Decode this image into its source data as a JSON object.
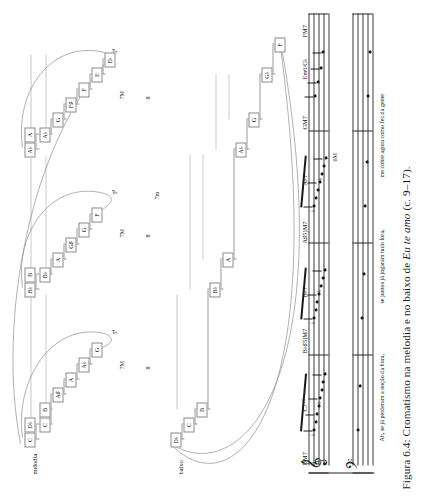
{
  "figure": {
    "caption_prefix": "Figura 6.4: Cromatismo na melodia e no baixo de ",
    "caption_italic": "Eu te amo",
    "caption_suffix": " (c. 9–17).",
    "voice_labels": {
      "melody": "melodia",
      "bass": "baixo"
    }
  },
  "melody_groups": [
    {
      "notes": [
        "C",
        "D♭",
        "C",
        "B",
        "A♯",
        "A",
        "A♭",
        "G"
      ],
      "bracket_label": "5ª"
    },
    {
      "notes": [
        "B♭",
        "B",
        "B♭",
        "A",
        "G♯",
        "G",
        "F"
      ],
      "bracket_label": "5ª"
    },
    {
      "notes": [
        "A♭",
        "A",
        "A♭",
        "G",
        "F♯",
        "F",
        "E",
        "E♭"
      ],
      "bracket_label": "5ª"
    }
  ],
  "bass_notes": [
    "D♭",
    "C",
    "B",
    "B♭",
    "A",
    "A♭",
    "G",
    "G♭",
    "F"
  ],
  "intervals": {
    "between_labels": [
      "7M",
      "8",
      "7M",
      "8",
      "7M",
      "8",
      "7M"
    ],
    "outer_melody_label": "7m",
    "outer_bass_label": "6M"
  },
  "score": {
    "chords": [
      "DM7",
      "C7⁺⁵",
      "B♭♯5)M7",
      "B♭7",
      "A♯5)M7",
      "A♭7",
      "GM7",
      "Em6/G♭",
      "FM7"
    ],
    "lyrics": [
      "Ah, se já perderam a noção da hora,",
      "se juntos já jogaram tudo fora,",
      "me cobre agora como fez da gente"
    ],
    "clef_treble": "𝄞",
    "clef_bass": "𝄢"
  }
}
